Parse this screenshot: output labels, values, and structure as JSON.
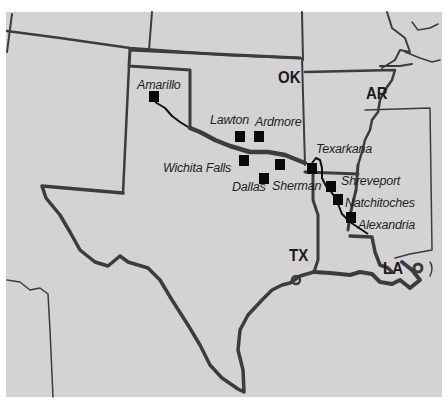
{
  "map": {
    "background_color": "#d3d3d3",
    "border_color": "#3a3a3a",
    "route_color": "#111111",
    "state_labels": [
      {
        "id": "ok",
        "text": "OK",
        "x": 278,
        "y": 69
      },
      {
        "id": "ar",
        "text": "AR",
        "x": 366,
        "y": 85
      },
      {
        "id": "tx",
        "text": "TX",
        "x": 289,
        "y": 247
      },
      {
        "id": "la",
        "text": "LA",
        "x": 383,
        "y": 260
      }
    ],
    "cities": [
      {
        "id": "amarillo",
        "name": "Amarillo",
        "label_x": 137,
        "label_y": 79,
        "marker_x": 149,
        "marker_y": 91
      },
      {
        "id": "lawton",
        "name": "Lawton",
        "label_x": 210,
        "label_y": 114,
        "marker_x": 235,
        "marker_y": 131
      },
      {
        "id": "ardmore",
        "name": "Ardmore",
        "label_x": 255,
        "label_y": 116,
        "marker_x": 254,
        "marker_y": 131
      },
      {
        "id": "wichita-falls",
        "name": "Wichita Falls",
        "label_x": 163,
        "label_y": 162,
        "marker_x": 239,
        "marker_y": 155
      },
      {
        "id": "dallas",
        "name": "Dallas",
        "label_x": 232,
        "label_y": 181,
        "marker_x": 259,
        "marker_y": 173
      },
      {
        "id": "sherman",
        "name": "Sherman",
        "label_x": 272,
        "label_y": 180,
        "marker_x": 275,
        "marker_y": 159
      },
      {
        "id": "texarkana",
        "name": "Texarkana",
        "label_x": 316,
        "label_y": 143,
        "marker_x": 307,
        "marker_y": 163
      },
      {
        "id": "shreveport",
        "name": "Shreveport",
        "label_x": 341,
        "label_y": 175,
        "marker_x": 326,
        "marker_y": 181
      },
      {
        "id": "natchitoches",
        "name": "Natchitoches",
        "label_x": 345,
        "label_y": 197,
        "marker_x": 333,
        "marker_y": 194
      },
      {
        "id": "alexandria",
        "name": "Alexandria",
        "label_x": 358,
        "label_y": 219,
        "marker_x": 346,
        "marker_y": 212
      }
    ]
  }
}
